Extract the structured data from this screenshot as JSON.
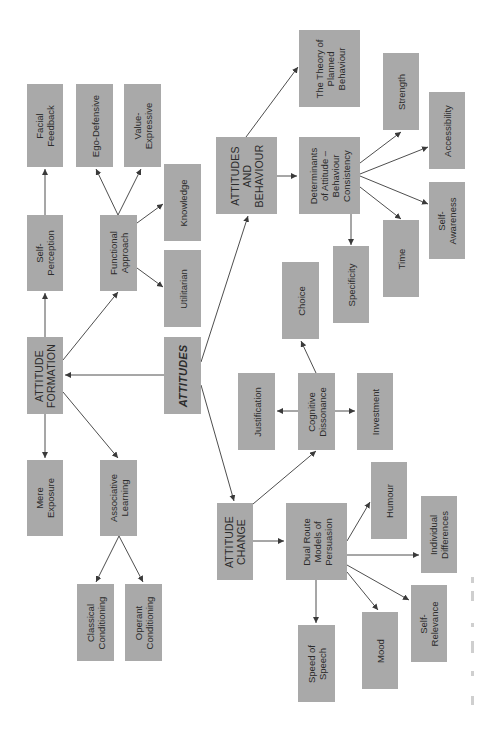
{
  "diagram": {
    "orientation": "rotated 90 degrees counter-clockwise",
    "colors": {
      "box_fill": "#a9a9a9",
      "text": "#2b2b2b",
      "edge": "#3a3a3a",
      "background": "#ffffff"
    },
    "nodes": {
      "attitudes": "ATTITUDES",
      "attitude_formation": "ATTITUDE\nFORMATION",
      "self_perception": "Self-\nPerception",
      "facial_feedback": "Facial\nFeedback",
      "functional_approach": "Functional\nApproach",
      "ego_defensive": "Ego-Defensive",
      "value_expressive": "Value-\nExpressive",
      "knowledge": "Knowledge",
      "utilitarian": "Utilitarian",
      "mere_exposure": "Mere\nExposure",
      "associative_learning": "Associative\nLearning",
      "classical_conditioning": "Classical\nConditioning",
      "operant_conditioning": "Operant\nConditioning",
      "attitudes_and_behaviour": "ATTITUDES\nAND\nBEHAVIOUR",
      "theory_planned_behaviour": "The Theory of\nPlanned\nBehaviour",
      "determinants": "Determinants\nof Attitude –\nBehaviour\nConsistency",
      "strength": "Strength",
      "accessibility": "Accessibility",
      "self_awareness": "Self-\nAwareness",
      "time": "Time",
      "specificity": "Specificity",
      "attitude_change": "ATTITUDE\nCHANGE",
      "cognitive_dissonance": "Cognitive\nDissonance",
      "choice": "Choice",
      "justification": "Justification",
      "investment": "Investment",
      "dual_route": "Dual Route\nModels of\nPersuasion",
      "humour": "Humour",
      "individual_differences": "Individual\nDifferences",
      "self_relevance": "Self-\nRelevance",
      "mood": "Mood",
      "speed_of_speech": "Speed of\nSpeech"
    },
    "edges": [
      [
        "attitudes",
        "attitude_formation"
      ],
      [
        "attitudes",
        "attitudes_and_behaviour"
      ],
      [
        "attitudes",
        "attitude_change"
      ],
      [
        "attitude_formation",
        "self_perception"
      ],
      [
        "attitude_formation",
        "functional_approach"
      ],
      [
        "attitude_formation",
        "mere_exposure"
      ],
      [
        "attitude_formation",
        "associative_learning"
      ],
      [
        "self_perception",
        "facial_feedback"
      ],
      [
        "functional_approach",
        "ego_defensive"
      ],
      [
        "functional_approach",
        "value_expressive"
      ],
      [
        "functional_approach",
        "knowledge"
      ],
      [
        "functional_approach",
        "utilitarian"
      ],
      [
        "associative_learning",
        "classical_conditioning"
      ],
      [
        "associative_learning",
        "operant_conditioning"
      ],
      [
        "attitudes_and_behaviour",
        "theory_planned_behaviour"
      ],
      [
        "attitudes_and_behaviour",
        "determinants"
      ],
      [
        "determinants",
        "strength"
      ],
      [
        "determinants",
        "accessibility"
      ],
      [
        "determinants",
        "self_awareness"
      ],
      [
        "determinants",
        "time"
      ],
      [
        "determinants",
        "specificity"
      ],
      [
        "attitude_change",
        "cognitive_dissonance"
      ],
      [
        "attitude_change",
        "dual_route"
      ],
      [
        "cognitive_dissonance",
        "choice"
      ],
      [
        "cognitive_dissonance",
        "justification"
      ],
      [
        "cognitive_dissonance",
        "investment"
      ],
      [
        "dual_route",
        "humour"
      ],
      [
        "dual_route",
        "individual_differences"
      ],
      [
        "dual_route",
        "self_relevance"
      ],
      [
        "dual_route",
        "mood"
      ],
      [
        "dual_route",
        "speed_of_speech"
      ]
    ]
  }
}
